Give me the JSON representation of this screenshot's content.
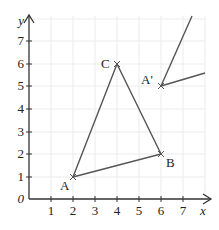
{
  "diagram": {
    "axes": {
      "x_label": "x",
      "y_label": "y",
      "origin_label": "0",
      "x_ticks": [
        "1",
        "2",
        "3",
        "4",
        "5",
        "6",
        "7"
      ],
      "y_ticks": [
        "1",
        "2",
        "3",
        "4",
        "5",
        "6",
        "7"
      ]
    },
    "points": {
      "A": {
        "label": "A",
        "x": 2,
        "y": 2
      },
      "B": {
        "label": "B",
        "x": 6,
        "y": 3
      },
      "C": {
        "label": "C",
        "x": 4,
        "y": 6
      },
      "A_prime": {
        "label": "A'",
        "x": 6,
        "y": 5
      }
    },
    "colors": {
      "line": "#555555",
      "grid": "#e8e8e8",
      "axis": "#333333"
    }
  }
}
